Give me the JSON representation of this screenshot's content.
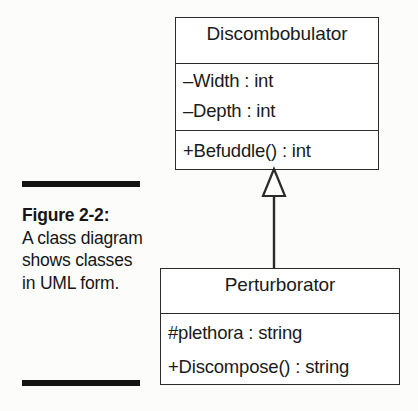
{
  "figure": {
    "caption_label": "Figure 2-2:",
    "caption_body": "A class diagram shows classes in UML form.",
    "rule_color": "#141414"
  },
  "diagram": {
    "type": "uml-class-diagram",
    "line_color": "#2b2b2b",
    "fill_color": "#ffffff",
    "classes": [
      {
        "name": "Discombobulator",
        "attributes": [
          "–Width : int",
          "–Depth : int"
        ],
        "operations": [
          "+Befuddle() : int"
        ]
      },
      {
        "name": "Perturborator",
        "members": [
          "#plethora : string",
          "+Discompose() : string"
        ]
      }
    ],
    "relationship": {
      "kind": "generalization",
      "arrowhead": "hollow-triangle",
      "from": "Perturborator",
      "to": "Discombobulator"
    }
  }
}
